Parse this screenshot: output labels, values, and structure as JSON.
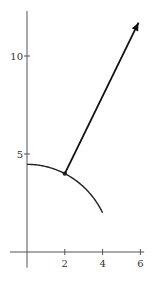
{
  "chart_data": {
    "type": "line",
    "title": "",
    "xlabel": "",
    "ylabel": "",
    "xlim": [
      -0.9,
      6.2
    ],
    "ylim": [
      -0.8,
      12.3
    ],
    "grid": false,
    "legend": null,
    "x_ticks": [
      {
        "value": 2,
        "label": "2"
      },
      {
        "value": 4,
        "label": "4"
      },
      {
        "value": 6,
        "label": "6"
      }
    ],
    "y_ticks": [
      {
        "value": 5,
        "label": "5"
      },
      {
        "value": 10,
        "label": "10"
      }
    ],
    "series": [
      {
        "name": "curve x^2 + y^2 = 20",
        "kind": "curve",
        "x": [
          0,
          0.5,
          1,
          1.5,
          2,
          2.5,
          3,
          3.5,
          4
        ],
        "y": [
          4.47,
          4.44,
          4.36,
          4.21,
          4.0,
          3.71,
          3.32,
          2.78,
          2.0
        ]
      },
      {
        "name": "point",
        "kind": "point",
        "x": [
          2
        ],
        "y": [
          4
        ]
      },
      {
        "name": "gradient vector",
        "kind": "arrow",
        "x": [
          2,
          5.9
        ],
        "y": [
          4,
          11.7
        ]
      }
    ]
  },
  "colors": {
    "axis": "#555555",
    "curve": "#222222",
    "arrow": "#111111",
    "text": "#333333"
  }
}
